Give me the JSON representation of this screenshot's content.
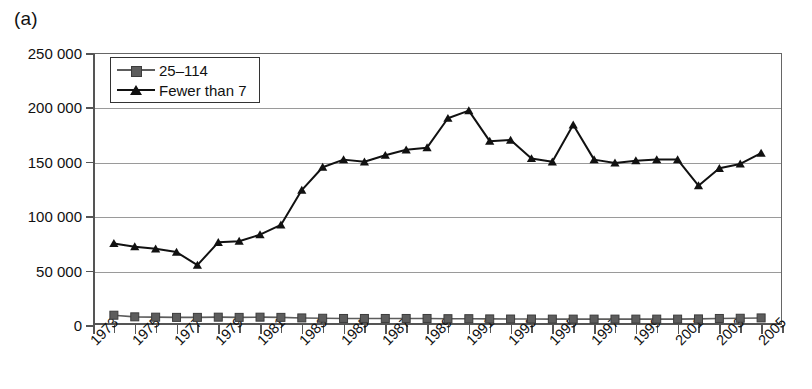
{
  "panel": {
    "label": "(a)"
  },
  "legend": {
    "position": "top-left-inside",
    "entries": [
      {
        "label": "25–114",
        "marker": "square",
        "color": "#5d5d5d"
      },
      {
        "label": "Fewer than 7",
        "marker": "triangle",
        "color": "#111111"
      }
    ]
  },
  "axes": {
    "y_tick_labels": [
      "250 000",
      "200 000",
      "150 000",
      "100 000",
      "50 000",
      "0"
    ],
    "x_tick_labels": [
      "1973",
      "1975",
      "1977",
      "1979",
      "1981",
      "1983",
      "1985",
      "1987",
      "1989",
      "1991",
      "1993",
      "1995",
      "1997",
      "1999",
      "2001",
      "2003",
      "2005"
    ]
  },
  "chart_data": {
    "type": "line",
    "title": "",
    "xlabel": "",
    "ylabel": "",
    "ylim": [
      0,
      250000
    ],
    "xlim": [
      1973,
      2006
    ],
    "yticks": [
      0,
      50000,
      100000,
      150000,
      200000,
      250000
    ],
    "ytick_labels": [
      "0",
      "50 000",
      "100 000",
      "150 000",
      "200 000",
      "250 000"
    ],
    "xticks": [
      1973,
      1974,
      1975,
      1976,
      1977,
      1978,
      1979,
      1980,
      1981,
      1982,
      1983,
      1984,
      1985,
      1986,
      1987,
      1988,
      1989,
      1990,
      1991,
      1992,
      1993,
      1994,
      1995,
      1996,
      1997,
      1998,
      1999,
      2000,
      2001,
      2002,
      2003,
      2004,
      2005,
      2006
    ],
    "xtick_labels_shown": [
      "1973",
      "1975",
      "1977",
      "1979",
      "1981",
      "1983",
      "1985",
      "1987",
      "1989",
      "1991",
      "1993",
      "1995",
      "1997",
      "1999",
      "2001",
      "2003",
      "2005"
    ],
    "grid": "horizontal",
    "legend_position": "upper left (inside)",
    "x": [
      1974,
      1975,
      1976,
      1977,
      1978,
      1979,
      1980,
      1981,
      1982,
      1983,
      1984,
      1985,
      1986,
      1987,
      1988,
      1989,
      1990,
      1991,
      1992,
      1993,
      1994,
      1995,
      1996,
      1997,
      1998,
      1999,
      2000,
      2001,
      2002,
      2003,
      2004,
      2005
    ],
    "series": [
      {
        "name": "Fewer than 7",
        "marker": "triangle",
        "color": "#111111",
        "values": [
          75000,
          72000,
          70000,
          67000,
          55000,
          76000,
          77000,
          83000,
          92000,
          124000,
          145000,
          152000,
          150000,
          156000,
          161000,
          163000,
          190000,
          197000,
          169000,
          170000,
          153000,
          150000,
          184000,
          152000,
          149000,
          151000,
          152000,
          152000,
          128000,
          144000,
          148000,
          158000
        ]
      },
      {
        "name": "25–114",
        "marker": "square",
        "color": "#5d5d5d",
        "values": [
          9000,
          7500,
          7200,
          7000,
          7000,
          7200,
          7000,
          7200,
          7000,
          6500,
          6200,
          6000,
          6000,
          6000,
          6000,
          6000,
          5800,
          5800,
          5600,
          5500,
          5500,
          5400,
          5400,
          5400,
          5400,
          5400,
          5400,
          5400,
          5600,
          6000,
          6200,
          6500
        ]
      }
    ]
  }
}
